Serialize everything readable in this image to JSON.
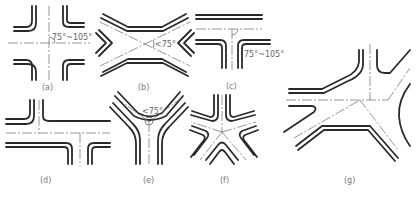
{
  "figure": {
    "panels": [
      {
        "id": "a",
        "label": "(a)",
        "type": "four-way crossroad",
        "angle_note": "75°~105°"
      },
      {
        "id": "b",
        "label": "(b)",
        "type": "X-shaped crossroad",
        "angle_note": "<75°"
      },
      {
        "id": "c",
        "label": "(c)",
        "type": "T-junction",
        "angle_note": "75°~105°"
      },
      {
        "id": "d",
        "label": "(d)",
        "type": "staggered (offset) junction",
        "angle_note": ""
      },
      {
        "id": "e",
        "label": "(e)",
        "type": "Y-junction",
        "angle_note": "<75°"
      },
      {
        "id": "f",
        "label": "(f)",
        "type": "five-way (multi-leg) junction",
        "angle_note": ""
      },
      {
        "id": "g",
        "label": "(g)",
        "type": "complex irregular junction",
        "angle_note": ""
      }
    ]
  },
  "colors": {
    "line": "#2a2a2a",
    "centerline": "#6a6a6a",
    "label": "#777777",
    "background": "#ffffff"
  }
}
